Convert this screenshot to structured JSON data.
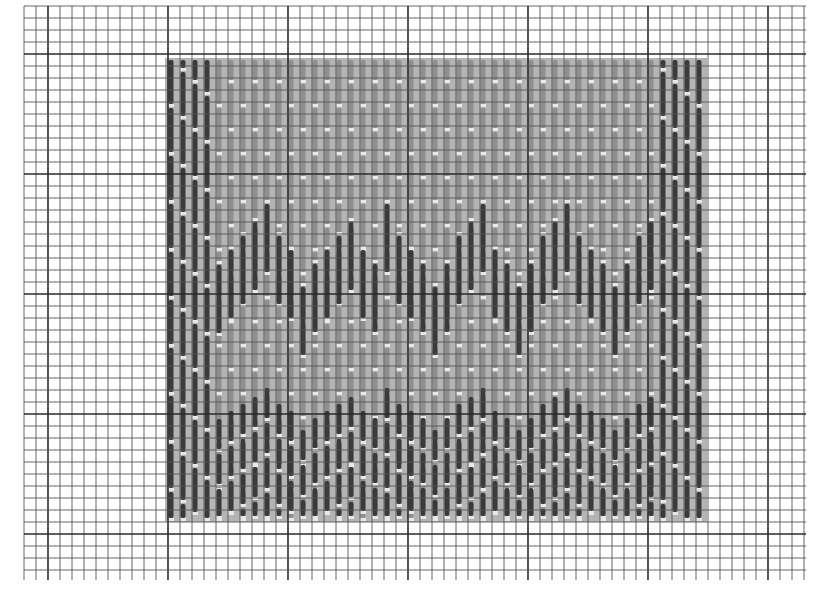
{
  "colors": {
    "paper": "#ffffff",
    "grid_minor": "#555555",
    "grid_major": "#2a2a2a",
    "field_fill": "#b4b4b4",
    "light_stitch": "#8f8f8f",
    "dark_stitch": "#3a3a3a",
    "stitch_gap": "#e8e8e8"
  },
  "grid": {
    "left": 24,
    "top": 6,
    "right": 806,
    "bottom": 580,
    "cell": 12,
    "major_every": 10
  },
  "pattern": {
    "left": 165,
    "top": 58,
    "right": 707,
    "bottom": 522,
    "column_pitch": 12,
    "border_columns_left": 4,
    "border_columns_right": 4,
    "border_stitch_length_cells": 4,
    "field_stitch_length_cells": 4,
    "accent_band": {
      "description": "dark zigzag stitches across upper-middle band",
      "stitch_length_cells": 4,
      "tops_px": [
        265,
        250,
        236,
        222,
        204,
        236,
        250,
        287,
        264,
        250,
        236,
        222,
        250,
        264,
        204,
        236,
        250,
        264,
        287,
        264,
        236,
        222,
        204,
        250,
        264,
        287,
        264,
        236,
        222,
        204,
        236,
        250,
        264,
        287,
        264,
        236,
        222,
        208,
        236,
        250,
        264,
        287
      ]
    },
    "lower_band": {
      "description": "dark stitches in staggered rows near bottom",
      "row_tops_px": [
        390,
        425,
        460,
        495
      ]
    }
  }
}
